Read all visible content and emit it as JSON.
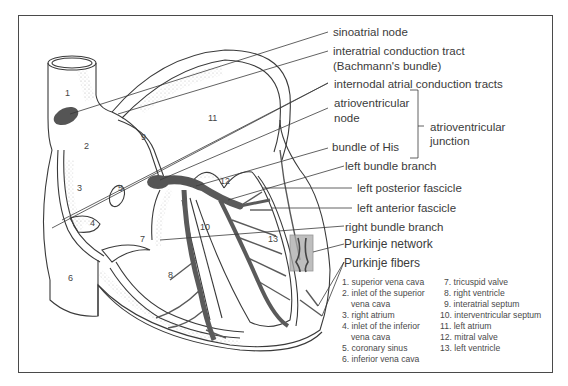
{
  "figure": {
    "callouts": [
      {
        "id": "sinoatrial-node",
        "text": "sinoatrial node"
      },
      {
        "id": "interatrial-tract",
        "text": "interatrial conduction tract"
      },
      {
        "id": "interatrial-tract-sub",
        "text": "(Bachmann's bundle)"
      },
      {
        "id": "internodal-tracts",
        "text": "internodal atrial conduction tracts"
      },
      {
        "id": "av-node-1",
        "text": "atrioventricular"
      },
      {
        "id": "av-node-2",
        "text": "node"
      },
      {
        "id": "av-junction-1",
        "text": "atrioventricular"
      },
      {
        "id": "av-junction-2",
        "text": "junction"
      },
      {
        "id": "bundle-of-his",
        "text": "bundle of His"
      },
      {
        "id": "left-bundle-branch",
        "text": "left bundle branch"
      },
      {
        "id": "left-posterior-fascicle",
        "text": "left posterior fascicle"
      },
      {
        "id": "left-anterior-fascicle",
        "text": "left anterior fascicle"
      },
      {
        "id": "right-bundle-branch",
        "text": "right bundle branch"
      },
      {
        "id": "purkinje-network",
        "text": "Purkinje network"
      },
      {
        "id": "purkinje-fibers",
        "text": "Purkinje fibers"
      }
    ],
    "numbers": [
      "1",
      "2",
      "3",
      "4",
      "5",
      "6",
      "7",
      "8",
      "9",
      "10",
      "11",
      "12",
      "13"
    ],
    "legend_left": [
      {
        "text": "1. superior vena cava"
      },
      {
        "text": "2. inlet of the superior"
      },
      {
        "text": "vena cava",
        "cont": true
      },
      {
        "text": "3. right atrium"
      },
      {
        "text": "4. inlet of the inferior"
      },
      {
        "text": "vena cava",
        "cont": true
      },
      {
        "text": "5. coronary sinus"
      },
      {
        "text": "6. inferior vena cava"
      }
    ],
    "legend_right": [
      {
        "text": "7. tricuspid valve"
      },
      {
        "text": "8. right ventricle"
      },
      {
        "text": "9. interatrial septum"
      },
      {
        "text": "10. interventricular septum"
      },
      {
        "text": "11. left atrium"
      },
      {
        "text": "12. mitral valve"
      },
      {
        "text": "13. left ventricle"
      }
    ],
    "colors": {
      "line": "#3a3a3a",
      "conduction": "#5e5e5e",
      "node": "#4d4d4d",
      "purkinje_box": "#a9a9a9",
      "stipple": "#9a9a9a"
    }
  }
}
